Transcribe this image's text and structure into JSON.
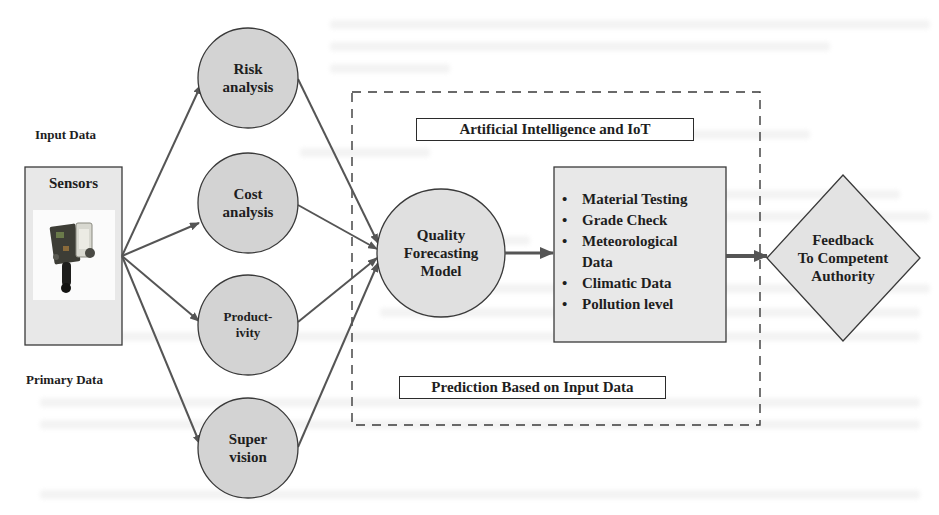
{
  "diagram": {
    "colors": {
      "node_fill": "#d3d3d3",
      "light_fill": "#e8e8e8",
      "stroke": "#3a3a3a",
      "arrow": "#555555",
      "background": "#ffffff"
    },
    "input": {
      "top_label": "Input Data",
      "bottom_label": "Primary Data",
      "sensors_box": {
        "title": "Sensors",
        "image_icon": "sensor-module-photo"
      }
    },
    "analysis_nodes": [
      {
        "id": "risk",
        "label": "Risk\nanalysis",
        "shape": "circle"
      },
      {
        "id": "cost",
        "label": "Cost\nanalysis",
        "shape": "circle"
      },
      {
        "id": "productivity",
        "label": "Product-\nivity",
        "shape": "circle"
      },
      {
        "id": "supervision",
        "label": "Super\nvision",
        "shape": "circle"
      }
    ],
    "ai_group": {
      "border_style": "dashed",
      "top_title": "Artificial Intelligence and IoT",
      "bottom_title": "Prediction Based on Input Data",
      "model_node": {
        "label": "Quality\nForecasting\nModel",
        "shape": "circle"
      },
      "parameters_box": {
        "items": [
          "Material Testing",
          "Grade Check",
          "Meteorological Data",
          "Climatic Data",
          "Pollution level"
        ],
        "items_display": [
          "Material Testing",
          "Grade Check",
          "Meteorological\nData",
          "Climatic Data",
          "Pollution level"
        ]
      }
    },
    "output": {
      "label": "Feedback\nTo Competent\nAuthority",
      "shape": "diamond"
    },
    "edges": [
      {
        "from": "sensors",
        "to": "risk"
      },
      {
        "from": "sensors",
        "to": "cost"
      },
      {
        "from": "sensors",
        "to": "productivity"
      },
      {
        "from": "sensors",
        "to": "supervision"
      },
      {
        "from": "risk",
        "to": "quality_forecasting_model"
      },
      {
        "from": "cost",
        "to": "quality_forecasting_model"
      },
      {
        "from": "productivity",
        "to": "quality_forecasting_model"
      },
      {
        "from": "supervision",
        "to": "quality_forecasting_model"
      },
      {
        "from": "quality_forecasting_model",
        "to": "parameters_box"
      },
      {
        "from": "parameters_box",
        "to": "feedback"
      }
    ]
  }
}
